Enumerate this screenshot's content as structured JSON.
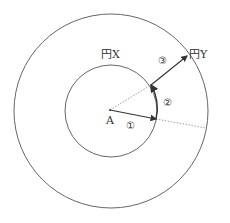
{
  "diagram": {
    "center_label": "A",
    "inner_circle_label": "円X",
    "outer_circle_label": "円Y",
    "steps": [
      {
        "id": 1,
        "symbol": "①"
      },
      {
        "id": 2,
        "symbol": "②"
      },
      {
        "id": 3,
        "symbol": "③"
      }
    ],
    "colors": {
      "line": "#444444",
      "dotted": "#888888",
      "background": "#ffffff"
    }
  }
}
